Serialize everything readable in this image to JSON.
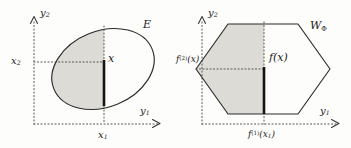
{
  "figure": {
    "type": "math-diagram",
    "background_color": "#fdfdfb",
    "ink_color": "#1a1a1a",
    "shade_color": "#dddbd6",
    "panels": [
      {
        "id": "left",
        "shape": "ellipse",
        "set_label": "E",
        "axis_vertical_label_base": "y",
        "axis_vertical_label_sub": "2",
        "axis_horizontal_label_base": "y",
        "axis_horizontal_label_sub": "1",
        "tick_vertical_label_base": "x",
        "tick_vertical_label_sub": "2",
        "tick_horizontal_label_base": "x",
        "tick_horizontal_label_sub": "1",
        "fiber_label": "x"
      },
      {
        "id": "right",
        "shape": "hexagon",
        "set_label_base": "W",
        "set_label_sub": "Φ",
        "axis_vertical_label_base": "y",
        "axis_vertical_label_sub": "2",
        "axis_horizontal_label_base": "y",
        "axis_horizontal_label_sub": "1",
        "tick_vertical_label": "f",
        "tick_vertical_sup": "(2)",
        "tick_vertical_arg": "(x)",
        "tick_horizontal_label": "f",
        "tick_horizontal_sup": "(1)",
        "tick_horizontal_arg_base": "(x",
        "tick_horizontal_arg_sub": "1",
        "tick_horizontal_arg_tail": ")",
        "fiber_label": "f(x)"
      }
    ]
  }
}
